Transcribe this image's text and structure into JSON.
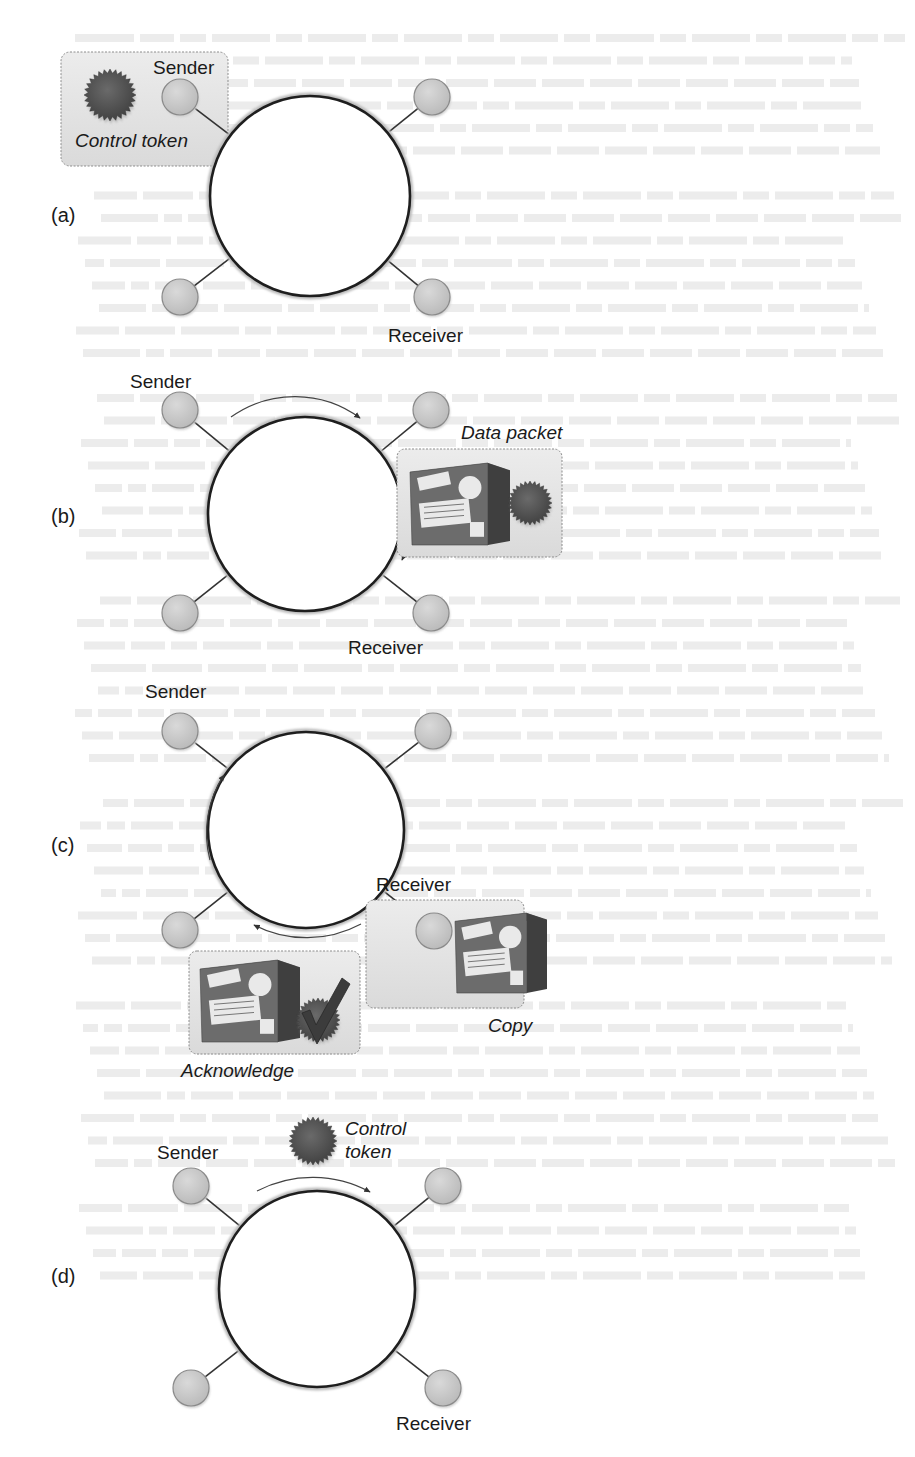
{
  "figure": {
    "panels": [
      {
        "id": "a",
        "label": "(a)",
        "sender_label": "Sender",
        "receiver_label": "Receiver",
        "callouts": [
          {
            "kind": "token-box",
            "caption": "Control token"
          }
        ],
        "arrows": []
      },
      {
        "id": "b",
        "label": "(b)",
        "sender_label": "Sender",
        "receiver_label": "Receiver",
        "callouts": [
          {
            "kind": "packet-box",
            "caption": "Data packet"
          }
        ],
        "arrows": [
          "top-clockwise",
          "right-clockwise"
        ]
      },
      {
        "id": "c",
        "label": "(c)",
        "sender_label": "Sender",
        "receiver_label": "Receiver",
        "callouts": [
          {
            "kind": "copy-box",
            "caption": "Copy"
          },
          {
            "kind": "ack-box",
            "caption": "Acknowledge"
          }
        ],
        "arrows": [
          "bottom-clockwise",
          "left-clockwise"
        ]
      },
      {
        "id": "d",
        "label": "(d)",
        "sender_label": "Sender",
        "receiver_label": "Receiver",
        "callouts": [
          {
            "kind": "free-token",
            "caption_line1": "Control",
            "caption_line2": "token"
          }
        ],
        "arrows": [
          "top-clockwise"
        ]
      }
    ]
  },
  "colors": {
    "ring_stroke": "#1e1e1e",
    "node_fill": "#c8c8c8",
    "node_stroke": "#8a8a8a",
    "token_fill": "#5a5a5a",
    "callout_bg": "#e3e3e3",
    "callout_border": "#8c8c8c",
    "box_body": "#6e6e6e",
    "box_label": "#e9e9e9",
    "bleed_text": "#ececec"
  }
}
